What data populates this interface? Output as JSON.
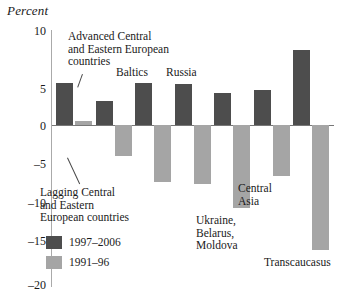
{
  "chart_data": {
    "type": "bar",
    "title": "Percent",
    "ylabel": "Percent",
    "xlabel": "",
    "ylim": [
      -20,
      10
    ],
    "yticks": [
      10,
      5,
      0,
      -5,
      -10,
      -15,
      -20
    ],
    "ytick_labels": [
      "10",
      "5",
      "0",
      "–5",
      "–10",
      "–15",
      "–20"
    ],
    "grid": false,
    "legend_position": "lower-left",
    "categories": [
      "Advanced Central and Eastern European countries",
      "Lagging Central and Eastern European countries",
      "Baltics",
      "Russia",
      "Ukraine, Belarus, Moldova",
      "Central Asia",
      "Transcaucasus"
    ],
    "series": [
      {
        "name": "1997–2006",
        "color": "#4d4d4d",
        "values": [
          5.5,
          3.2,
          5.5,
          5.4,
          4.2,
          4.6,
          9.8
        ]
      },
      {
        "name": "1991–96",
        "color": "#a5a5a5",
        "values": [
          0.5,
          -4.0,
          -7.5,
          -7.7,
          -10.8,
          -6.7,
          -16.3
        ]
      }
    ],
    "annotations": [
      {
        "text": "Advanced Central\nand Eastern European\ncountries",
        "target": "group-1-dark"
      },
      {
        "text": "Lagging Central\nand Eastern\nEuropean countries",
        "target": "group-2-light"
      },
      {
        "text": "Baltics",
        "target": "group-3"
      },
      {
        "text": "Russia",
        "target": "group-4"
      },
      {
        "text": "Ukraine,\nBelarus,\nMoldova",
        "target": "group-5"
      },
      {
        "text": "Central\nAsia",
        "target": "group-6"
      },
      {
        "text": "Transcaucasus",
        "target": "group-7"
      }
    ]
  },
  "labels": {
    "axis_title": "Percent",
    "tick_10": "10",
    "tick_5": "5",
    "tick_0": "0",
    "tick_m5": "–5",
    "tick_m10": "–10",
    "tick_m15": "–15",
    "tick_m20": "–20",
    "annot_advanced": "Advanced Central\nand Eastern European\ncountries",
    "annot_lagging": "Lagging Central\nand Eastern\nEuropean countries",
    "annot_baltics": "Baltics",
    "annot_russia": "Russia",
    "annot_ukraine": "Ukraine,\nBelarus,\nMoldova",
    "annot_central_asia": "Central\nAsia",
    "annot_transcaucasus": "Transcaucasus"
  },
  "legend": {
    "items": [
      {
        "label": "1997–2006",
        "color": "#4d4d4d"
      },
      {
        "label": "1991–96",
        "color": "#a5a5a5"
      }
    ]
  }
}
